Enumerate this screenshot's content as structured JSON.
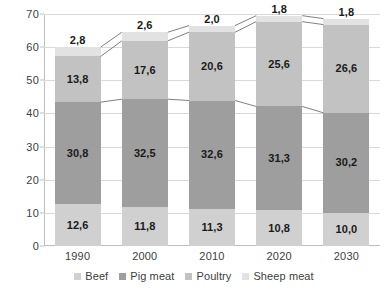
{
  "chart_data": {
    "type": "bar",
    "stacked": true,
    "title": "",
    "xlabel": "",
    "ylabel": "",
    "categories": [
      "1990",
      "2000",
      "2010",
      "2020",
      "2030"
    ],
    "ylim": [
      0,
      70
    ],
    "yticks": [
      0,
      10,
      20,
      30,
      40,
      50,
      60,
      70
    ],
    "ytick_labels": [
      "0",
      "10",
      "20",
      "30",
      "40",
      "50",
      "60",
      "70"
    ],
    "grid": true,
    "legend_position": "bottom",
    "decimal_separator": ",",
    "series": [
      {
        "name": "Beef",
        "color": "#d0d0d0",
        "values": [
          12.6,
          11.8,
          11.3,
          10.8,
          10.0
        ],
        "labels": [
          "12,6",
          "11,8",
          "11,3",
          "10,8",
          "10,0"
        ]
      },
      {
        "name": "Pig meat",
        "color": "#9e9e9e",
        "values": [
          30.8,
          32.5,
          32.6,
          31.3,
          30.2
        ],
        "labels": [
          "30,8",
          "32,5",
          "32,6",
          "31,3",
          "30,2"
        ]
      },
      {
        "name": "Poultry",
        "color": "#c2c2c2",
        "values": [
          13.8,
          17.6,
          20.6,
          25.6,
          26.6
        ],
        "labels": [
          "13,8",
          "17,6",
          "20,6",
          "25,6",
          "26,6"
        ]
      },
      {
        "name": "Sheep meat",
        "color": "#e2e2e2",
        "values": [
          2.8,
          2.6,
          2.0,
          1.8,
          1.8
        ],
        "labels": [
          "2,8",
          "2,6",
          "2,0",
          "1,8",
          "1,8"
        ]
      }
    ],
    "totals": [
      60.0,
      64.5,
      66.5,
      69.5,
      68.6
    ],
    "series_lines": true,
    "series_line_color": "#808080",
    "grid_color": "#d9d9d9",
    "axis_color": "#bfbfbf",
    "text_color": "#404040",
    "label_color": "#1a1a1a"
  }
}
